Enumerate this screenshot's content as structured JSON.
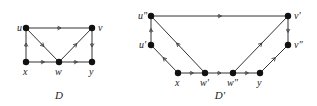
{
  "figure": {
    "background": "#ffffff",
    "edge_color": "#333333",
    "node_color": "#111111",
    "graphs": [
      {
        "id": "D",
        "caption": "D",
        "caption_pos": [
          59,
          99
        ],
        "nodes": [
          {
            "id": "u",
            "label": "u",
            "x": 26,
            "y": 28,
            "lx": 17,
            "ly": 31
          },
          {
            "id": "v",
            "label": "v",
            "x": 92,
            "y": 28,
            "lx": 98,
            "ly": 31
          },
          {
            "id": "x",
            "label": "x",
            "x": 26,
            "y": 62,
            "lx": 23,
            "ly": 75
          },
          {
            "id": "w",
            "label": "w",
            "x": 59,
            "y": 62,
            "lx": 55,
            "ly": 75
          },
          {
            "id": "y",
            "label": "y",
            "x": 92,
            "y": 62,
            "lx": 89,
            "ly": 75
          }
        ],
        "edges": [
          {
            "from": "u",
            "to": "v"
          },
          {
            "from": "x",
            "to": "u"
          },
          {
            "from": "u",
            "to": "w"
          },
          {
            "from": "x",
            "to": "w"
          },
          {
            "from": "w",
            "to": "v"
          },
          {
            "from": "w",
            "to": "y"
          },
          {
            "from": "v",
            "to": "y"
          }
        ]
      },
      {
        "id": "D-prime",
        "caption": "D'",
        "caption_pos": [
          220,
          99
        ],
        "nodes": [
          {
            "id": "u2",
            "label": "u\"",
            "x": 151,
            "y": 16,
            "lx": 138,
            "ly": 19
          },
          {
            "id": "u1",
            "label": "u'",
            "x": 151,
            "y": 45,
            "lx": 139,
            "ly": 48
          },
          {
            "id": "v1",
            "label": "v'",
            "x": 288,
            "y": 16,
            "lx": 294,
            "ly": 19
          },
          {
            "id": "v2",
            "label": "v\"",
            "x": 288,
            "y": 45,
            "lx": 294,
            "ly": 48
          },
          {
            "id": "x",
            "label": "x",
            "x": 178,
            "y": 73,
            "lx": 175,
            "ly": 86
          },
          {
            "id": "w1",
            "label": "w'",
            "x": 205,
            "y": 73,
            "lx": 200,
            "ly": 86
          },
          {
            "id": "w2",
            "label": "w\"",
            "x": 233,
            "y": 73,
            "lx": 227,
            "ly": 86
          },
          {
            "id": "y",
            "label": "y",
            "x": 260,
            "y": 73,
            "lx": 257,
            "ly": 86
          }
        ],
        "edges": [
          {
            "from": "u2",
            "to": "v1"
          },
          {
            "from": "u1",
            "to": "u2"
          },
          {
            "from": "w1",
            "to": "u2"
          },
          {
            "from": "x",
            "to": "u1"
          },
          {
            "from": "x",
            "to": "w1"
          },
          {
            "from": "w1",
            "to": "w2"
          },
          {
            "from": "w2",
            "to": "v1"
          },
          {
            "from": "w2",
            "to": "y"
          },
          {
            "from": "v1",
            "to": "v2"
          },
          {
            "from": "y",
            "to": "v2"
          }
        ]
      }
    ]
  }
}
